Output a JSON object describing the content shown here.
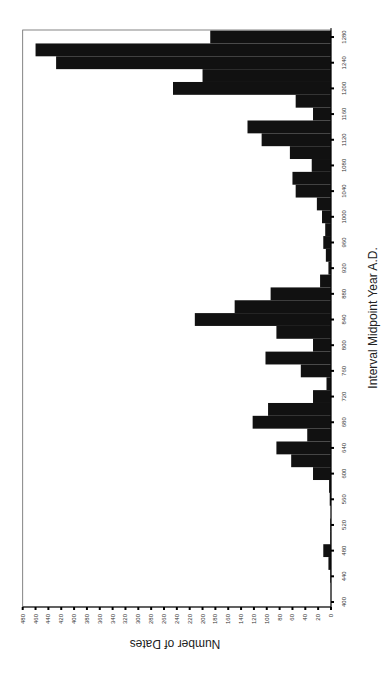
{
  "chart_data": {
    "type": "bar",
    "orientation": "rotated-90-clockwise (years run bottom-to-top on right edge, counts extend leftward)",
    "title": "",
    "xlabel": "Interval Midpoint Year A.D.",
    "ylabel": "Number of Dates",
    "xlim": [
      400,
      1280
    ],
    "ylim": [
      0,
      480
    ],
    "x_ticks": [
      400,
      440,
      480,
      520,
      560,
      600,
      640,
      680,
      720,
      760,
      800,
      840,
      880,
      920,
      960,
      1000,
      1040,
      1080,
      1120,
      1160,
      1200,
      1240,
      1280
    ],
    "y_ticks": [
      0,
      20,
      40,
      60,
      80,
      100,
      120,
      140,
      160,
      180,
      200,
      220,
      240,
      260,
      280,
      300,
      320,
      340,
      360,
      380,
      400,
      420,
      440,
      460,
      480
    ],
    "grid": false,
    "legend": null,
    "bar_width_years": 20,
    "categories": [
      400,
      420,
      440,
      460,
      480,
      500,
      520,
      540,
      560,
      580,
      600,
      620,
      640,
      660,
      680,
      700,
      720,
      740,
      760,
      780,
      800,
      820,
      840,
      860,
      880,
      900,
      920,
      940,
      960,
      980,
      1000,
      1020,
      1040,
      1060,
      1080,
      1100,
      1120,
      1140,
      1160,
      1180,
      1200,
      1220,
      1240,
      1260,
      1280
    ],
    "values": [
      0,
      0,
      1,
      4,
      12,
      1,
      1,
      0,
      2,
      3,
      28,
      62,
      85,
      37,
      122,
      98,
      28,
      7,
      47,
      102,
      28,
      85,
      212,
      150,
      94,
      17,
      4,
      8,
      12,
      9,
      14,
      22,
      55,
      60,
      30,
      64,
      108,
      130,
      28,
      55,
      246,
      200,
      428,
      460,
      188
    ],
    "bar_color": "#111111"
  }
}
